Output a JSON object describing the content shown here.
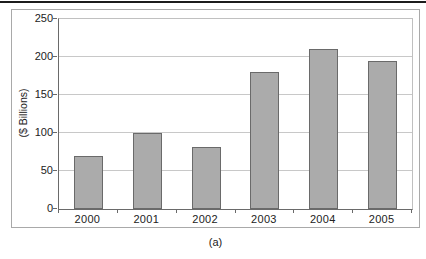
{
  "caption": "(a)",
  "colors": {
    "bar_fill": "#ababab",
    "bar_border": "#6a6a6a",
    "gridline": "#c8c8c8",
    "axis": "#6a6a6a",
    "frame_border": "#a9a9a9",
    "top_rule": "#1c1c1c",
    "text": "#222222"
  },
  "chart_data": {
    "type": "bar",
    "categories": [
      "2000",
      "2001",
      "2002",
      "2003",
      "2004",
      "2005"
    ],
    "values": [
      70,
      100,
      82,
      180,
      210,
      195
    ],
    "title": "",
    "xlabel": "",
    "ylabel": "($ Billions)",
    "ylim": [
      0,
      250
    ],
    "yticks": [
      0,
      50,
      100,
      150,
      200,
      250
    ],
    "grid": true,
    "legend": "none"
  }
}
